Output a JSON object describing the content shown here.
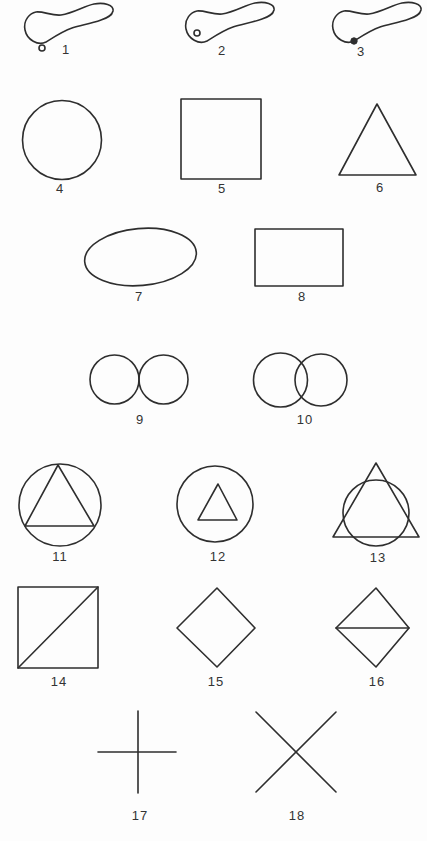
{
  "figure": {
    "colors": {
      "ink": "#2e2e2e",
      "paper": "#fdfdfd"
    },
    "shapes": [
      {
        "label": "1",
        "kind": "blob-outline-dot-outside"
      },
      {
        "label": "2",
        "kind": "blob-outline-dot-inside"
      },
      {
        "label": "3",
        "kind": "blob-outline-dot-on-boundary"
      },
      {
        "label": "4",
        "kind": "circle"
      },
      {
        "label": "5",
        "kind": "square"
      },
      {
        "label": "6",
        "kind": "triangle"
      },
      {
        "label": "7",
        "kind": "ellipse"
      },
      {
        "label": "8",
        "kind": "rectangle"
      },
      {
        "label": "9",
        "kind": "two-tangent-circles"
      },
      {
        "label": "10",
        "kind": "two-overlapping-circles"
      },
      {
        "label": "11",
        "kind": "triangle-inscribed-in-circle"
      },
      {
        "label": "12",
        "kind": "small-triangle-inside-circle"
      },
      {
        "label": "13",
        "kind": "triangle-overlapping-circle"
      },
      {
        "label": "14",
        "kind": "square-with-diagonal"
      },
      {
        "label": "15",
        "kind": "diamond"
      },
      {
        "label": "16",
        "kind": "diamond-with-horizontal-line"
      },
      {
        "label": "17",
        "kind": "plus-cross"
      },
      {
        "label": "18",
        "kind": "x-cross"
      }
    ]
  }
}
